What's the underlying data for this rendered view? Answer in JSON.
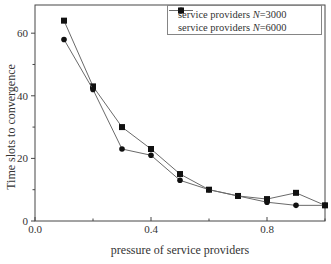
{
  "figure": {
    "background": "#ffffff",
    "frame_color": "#474747",
    "text_color": "#333333"
  },
  "chart_data": {
    "type": "line",
    "title": "",
    "xlabel": "pressure of service providers",
    "ylabel": "Time slots to convergence",
    "xlim": [
      0.0,
      1.0
    ],
    "ylim": [
      0,
      69
    ],
    "grid": false,
    "legend_position": "top-right",
    "legend_border_color": "#858585",
    "line_color": "#6a6a6a",
    "marker_color": "#111111",
    "x_major_ticks": [
      0.0,
      0.4,
      0.8
    ],
    "x_tick_labels": [
      "0.0",
      "0.4",
      "0.8"
    ],
    "x_minor_ticks": [
      0.2,
      0.6,
      1.0
    ],
    "y_major_ticks": [
      0,
      20,
      40,
      60
    ],
    "y_tick_labels": [
      "0",
      "20",
      "40",
      "60"
    ],
    "y_minor_ticks": [
      10,
      30,
      50
    ],
    "x": [
      0.1,
      0.2,
      0.3,
      0.4,
      0.5,
      0.6,
      0.7,
      0.8,
      0.9,
      1.0
    ],
    "series": [
      {
        "name": "service providers N=3000",
        "name_prefix": "service providers ",
        "name_var": "N",
        "name_suffix": "=3000",
        "marker": "square",
        "values": [
          64,
          43,
          30,
          23,
          15,
          10,
          8,
          7,
          9,
          5
        ]
      },
      {
        "name": "service providers N=6000",
        "name_prefix": "service providers ",
        "name_var": "N",
        "name_suffix": "=6000",
        "marker": "circle",
        "values": [
          58,
          42,
          23,
          21,
          13,
          10,
          8,
          6,
          5,
          5
        ]
      }
    ]
  }
}
